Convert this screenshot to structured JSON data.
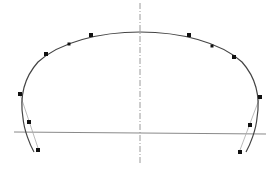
{
  "diagram": {
    "type": "spline-curve-with-control-points",
    "colors": {
      "background": "#ffffff",
      "curve": "#444444",
      "axis": "#9a9a9a",
      "baseline": "#8a8a8a",
      "control_line": "#aaaaaa",
      "point": "#111111"
    },
    "axis_vertical": {
      "x": 140,
      "y1": 3,
      "y2": 163,
      "style": "dash-dot"
    },
    "baseline": {
      "x1": 14,
      "y1": 132,
      "x2": 266,
      "y2": 134
    },
    "curve_path": "M34,152 C30,145 24,130 23,118 C20,100 22,80 38,62 C60,42 100,32 140,32 C180,32 220,42 242,62 C258,80 260,100 257,118 C256,130 250,145 246,152",
    "control_lines": [
      {
        "x1": 20,
        "y1": 94,
        "x2": 38,
        "y2": 148
      },
      {
        "x1": 260,
        "y1": 97,
        "x2": 240,
        "y2": 150
      }
    ],
    "control_points": [
      {
        "x": 20,
        "y": 94,
        "size": 4
      },
      {
        "x": 29,
        "y": 122,
        "size": 4
      },
      {
        "x": 38,
        "y": 150,
        "size": 4
      },
      {
        "x": 46,
        "y": 54,
        "size": 4
      },
      {
        "x": 69,
        "y": 44,
        "size": 3
      },
      {
        "x": 91,
        "y": 35,
        "size": 4
      },
      {
        "x": 189,
        "y": 35,
        "size": 4
      },
      {
        "x": 212,
        "y": 46,
        "size": 3
      },
      {
        "x": 234,
        "y": 57,
        "size": 4
      },
      {
        "x": 260,
        "y": 97,
        "size": 4
      },
      {
        "x": 250,
        "y": 125,
        "size": 4
      },
      {
        "x": 240,
        "y": 152,
        "size": 4
      }
    ]
  }
}
